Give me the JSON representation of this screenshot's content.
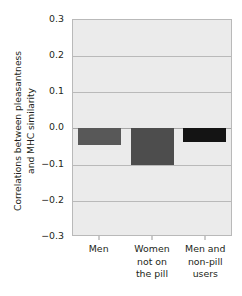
{
  "chart_data": {
    "type": "bar",
    "title": "",
    "subtitle": "",
    "xlabel": "",
    "ylabel_line1": "Correlations between pleasantness",
    "ylabel_line2": "and MHC similarity",
    "categories": [
      "Men",
      "Women not on the pill",
      "Men and non-pill users"
    ],
    "category_lines": [
      [
        "Men"
      ],
      [
        "Women",
        "not on",
        "the pill"
      ],
      [
        "Men and",
        "non-pill",
        "users"
      ]
    ],
    "values": [
      -0.05,
      -0.105,
      -0.04
    ],
    "ylim": [
      -0.3,
      0.3
    ],
    "yticks": [
      0.3,
      0.2,
      0.1,
      0.0,
      -0.1,
      -0.2,
      -0.3
    ],
    "ytick_labels": [
      "0.3",
      "0.2",
      "0.1",
      "0.0",
      "−0.1",
      "−0.2",
      "−0.3"
    ],
    "grid": true,
    "legend": "none",
    "bar_colors": [
      "#585858",
      "#4d4d4d",
      "#141414"
    ],
    "plot_background": "#ebebeb",
    "gridline_color": "#b9b9b9",
    "axis_color": "#b9b9b9",
    "text_color": "#231f20"
  }
}
